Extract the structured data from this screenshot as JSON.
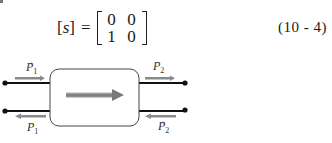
{
  "equation": {
    "lhs_symbol": "s",
    "lhs_open": "[",
    "lhs_close": "]",
    "equals": "=",
    "matrix": [
      [
        "0",
        "0"
      ],
      [
        "1",
        "0"
      ]
    ],
    "number": "(10 - 4)"
  },
  "diagram": {
    "labels": {
      "top_left": {
        "base": "P",
        "sub": "1",
        "sup": "+"
      },
      "top_right": {
        "base": "P",
        "sub": "2",
        "sup": "−"
      },
      "bottom_left": {
        "base": "P",
        "sub": "1",
        "sup": "−"
      },
      "bottom_right": {
        "base": "P",
        "sub": "2",
        "sup": "+"
      }
    },
    "colors": {
      "line": "#111111",
      "arrow": "#8a8a8a",
      "box_border": "#444444"
    }
  }
}
